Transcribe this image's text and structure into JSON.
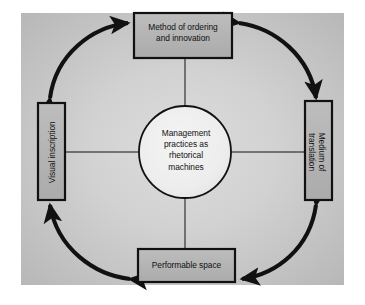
{
  "figure": {
    "kind": "cycle-diagram",
    "background_color": "#ffffff",
    "canvas_color": "#c9c9c9",
    "box_fill_color": "#b4b4b4",
    "circle_fill_color": "#efefef",
    "stroke_color": "#111111"
  },
  "center": {
    "label": "Management\npractices as\nrhetorical\nmachines"
  },
  "nodes": {
    "top": {
      "label": "Method of ordering\nand innovation"
    },
    "right": {
      "label": "Medium of\ntranslation"
    },
    "bottom": {
      "label": "Performable space"
    },
    "left": {
      "label": "Visual inscription"
    }
  },
  "connectors": {
    "arcs": [
      {
        "name": "top-left-arc",
        "from": "left",
        "to": "top",
        "double_headed": true
      },
      {
        "name": "top-right-arc",
        "from": "top",
        "to": "right",
        "double_headed": true
      },
      {
        "name": "bottom-right-arc",
        "from": "right",
        "to": "bottom",
        "double_headed": true
      },
      {
        "name": "bottom-left-arc",
        "from": "bottom",
        "to": "left",
        "double_headed": true
      }
    ],
    "spokes": [
      {
        "name": "spoke-top",
        "from": "top",
        "to": "center"
      },
      {
        "name": "spoke-right",
        "from": "right",
        "to": "center"
      },
      {
        "name": "spoke-bottom",
        "from": "bottom",
        "to": "center"
      },
      {
        "name": "spoke-left",
        "from": "left",
        "to": "center"
      }
    ]
  }
}
